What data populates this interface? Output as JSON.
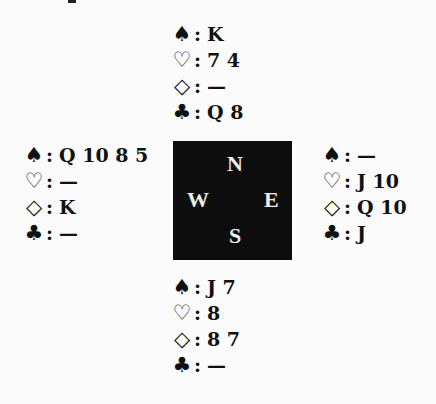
{
  "diagram": {
    "type": "bridge-deal",
    "symbols": {
      "spade": "♠",
      "heart": "♡",
      "diamond": "◇",
      "club": "♣",
      "colon": ":"
    },
    "compass": {
      "north": "N",
      "south": "S",
      "east": "E",
      "west": "W"
    },
    "hands": {
      "north": {
        "spades": "K",
        "hearts": "7 4",
        "diamonds": "—",
        "clubs": "Q 8"
      },
      "west": {
        "spades": "Q 10 8 5",
        "hearts": "—",
        "diamonds": "K",
        "clubs": "—"
      },
      "east": {
        "spades": "—",
        "hearts": "J 10",
        "diamonds": "Q 10",
        "clubs": "J"
      },
      "south": {
        "spades": "J 7",
        "hearts": "8",
        "diamonds": "8 7",
        "clubs": "—"
      }
    }
  }
}
